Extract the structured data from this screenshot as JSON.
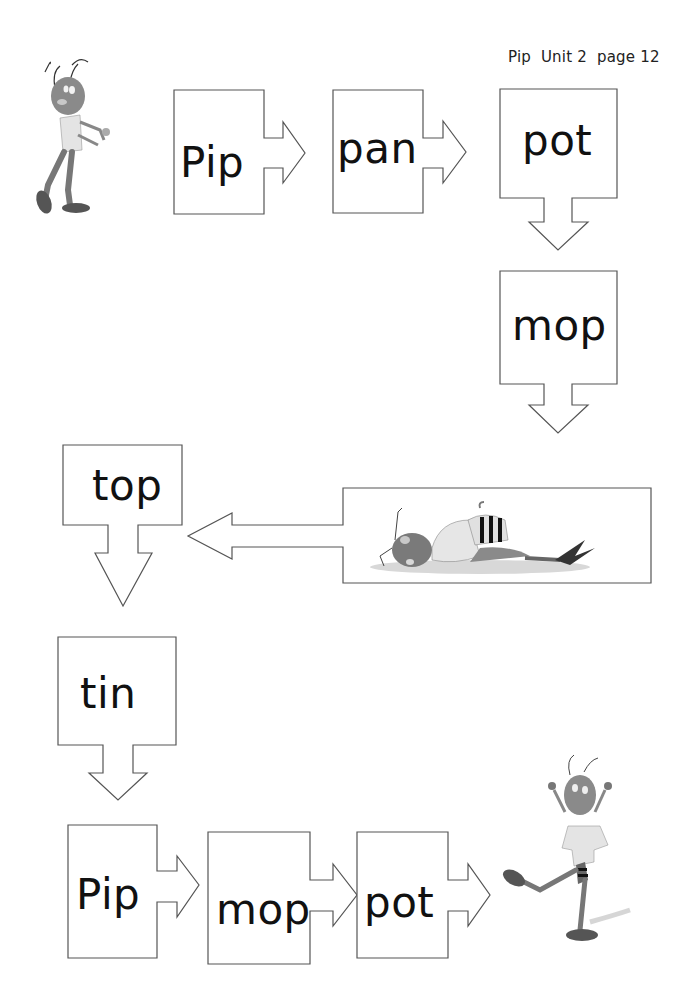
{
  "header": {
    "title": "Pip  Unit 2  page 12"
  },
  "flow": {
    "words": [
      {
        "id": "pip-1",
        "label": "Pip"
      },
      {
        "id": "pan",
        "label": "pan"
      },
      {
        "id": "pot-1",
        "label": "pot"
      },
      {
        "id": "mop-1",
        "label": "mop"
      },
      {
        "id": "top",
        "label": "top"
      },
      {
        "id": "tin",
        "label": "tin"
      },
      {
        "id": "pip-2",
        "label": "Pip"
      },
      {
        "id": "mop-2",
        "label": "mop"
      },
      {
        "id": "pot-2",
        "label": "pot"
      }
    ]
  },
  "illustrations": {
    "top_left": "ant-standing-illustration",
    "middle": "ant-lying-down-illustration",
    "bottom_right": "ant-dancing-illustration"
  },
  "colors": {
    "stroke": "#555555",
    "text": "#111111",
    "background": "#ffffff"
  }
}
